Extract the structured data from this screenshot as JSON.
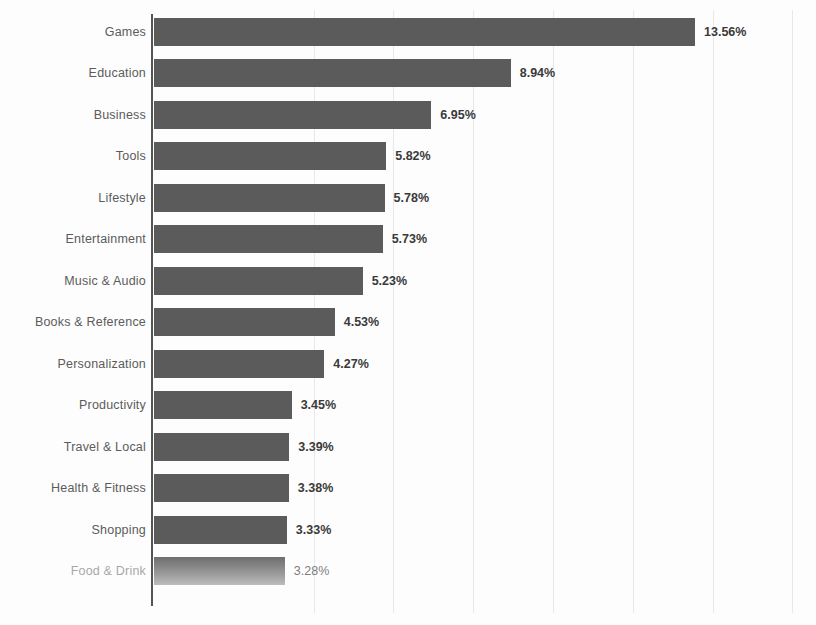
{
  "chart_data": {
    "type": "bar",
    "orientation": "horizontal",
    "title": "",
    "xlabel": "",
    "ylabel": "",
    "grid": true,
    "legend": false,
    "value_suffix": "%",
    "xlim": [
      0,
      16.5
    ],
    "gridline_values": [
      4,
      6,
      8,
      10,
      12,
      14,
      16
    ],
    "categories": [
      "Games",
      "Education",
      "Business",
      "Tools",
      "Lifestyle",
      "Entertainment",
      "Music & Audio",
      "Books & Reference",
      "Personalization",
      "Productivity",
      "Travel & Local",
      "Health & Fitness",
      "Shopping",
      "Food & Drink"
    ],
    "values": [
      13.56,
      8.94,
      6.95,
      5.82,
      5.78,
      5.73,
      5.23,
      4.53,
      4.27,
      3.45,
      3.39,
      3.38,
      3.33,
      3.28
    ],
    "labels": [
      "13.56%",
      "8.94%",
      "6.95%",
      "5.82%",
      "5.78%",
      "5.73%",
      "5.23%",
      "4.53%",
      "4.27%",
      "3.45%",
      "3.39%",
      "3.38%",
      "3.33%",
      "3.28%"
    ],
    "faded_index": 13,
    "colors": {
      "bar": "#5b5b5b",
      "bar_faded": "#9a9a9a",
      "category_label": "#5b5b5b",
      "category_label_faded": "#a8a8a8",
      "value_label": "#3a3a3a",
      "gridline": "#e8e8e8",
      "axis": "#555555",
      "background": "#fdfdfd"
    }
  }
}
